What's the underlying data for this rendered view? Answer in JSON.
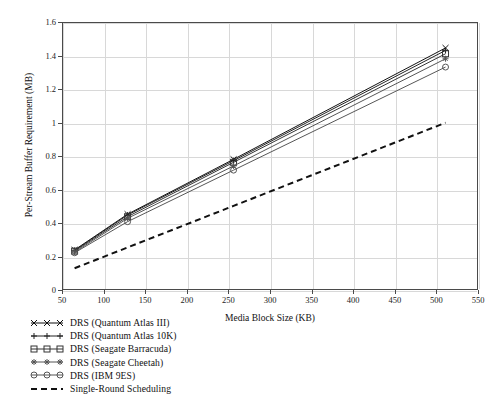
{
  "chart_data": {
    "type": "line",
    "title": "",
    "xlabel": "Media Block Size (KB)",
    "ylabel": "Per-Stream Buffer Requirement (MB)",
    "xlim": [
      50,
      550
    ],
    "ylim": [
      0,
      1.6
    ],
    "xticks": [
      50,
      100,
      150,
      200,
      250,
      300,
      350,
      400,
      450,
      500,
      550
    ],
    "yticks": [
      0,
      0.2,
      0.4,
      0.6,
      0.8,
      1,
      1.2,
      1.4,
      1.6
    ],
    "xtick_labels": [
      "50",
      "100",
      "150",
      "200",
      "250",
      "300",
      "350",
      "400",
      "450",
      "500",
      "550"
    ],
    "ytick_labels": [
      "0",
      "0.2",
      "0.4",
      "0.6",
      "0.8",
      "1",
      "1.2",
      "1.4",
      "1.6"
    ],
    "grid": "both",
    "legend_position": "below-left",
    "x": [
      64,
      128,
      256,
      512
    ],
    "series": [
      {
        "name": "DRS (Quantum Atlas III)",
        "marker": "x",
        "linestyle": "solid",
        "color": "#111111",
        "values": [
          0.235,
          0.45,
          0.78,
          1.45
        ]
      },
      {
        "name": "DRS (Quantum Atlas 10K)",
        "marker": "plus",
        "linestyle": "solid",
        "color": "#222222",
        "values": [
          0.232,
          0.445,
          0.772,
          1.435
        ]
      },
      {
        "name": "DRS (Seagate Barracuda)",
        "marker": "square",
        "linestyle": "solid",
        "color": "#333333",
        "values": [
          0.228,
          0.435,
          0.762,
          1.415
        ]
      },
      {
        "name": "DRS (Seagate Cheetah)",
        "marker": "star",
        "linestyle": "solid",
        "color": "#555555",
        "values": [
          0.222,
          0.425,
          0.74,
          1.385
        ]
      },
      {
        "name": "DRS (IBM 9ES)",
        "marker": "circle",
        "linestyle": "solid",
        "color": "#555555",
        "values": [
          0.218,
          0.405,
          0.715,
          1.335
        ]
      },
      {
        "name": "Single-Round Scheduling",
        "marker": "none",
        "linestyle": "dashed",
        "color": "#111111",
        "values": [
          0.125,
          0.25,
          0.5,
          1.0
        ]
      }
    ]
  }
}
